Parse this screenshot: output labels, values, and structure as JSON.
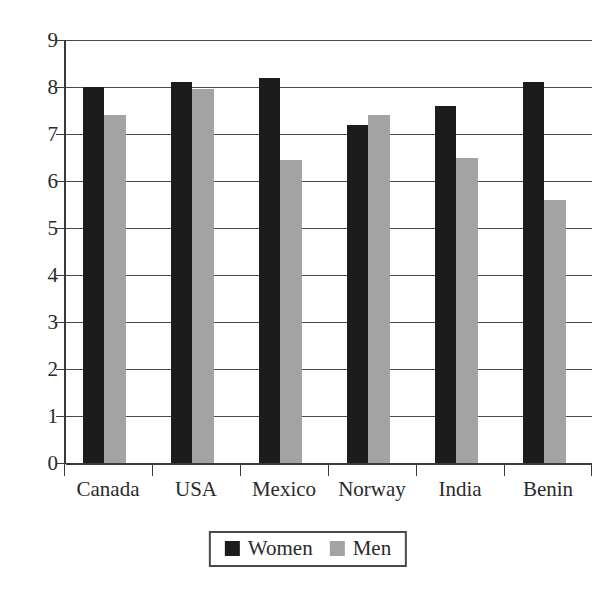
{
  "chart_data": {
    "type": "bar",
    "title": "",
    "subtitle": "",
    "xlabel": "",
    "ylabel": "",
    "categories": [
      "Canada",
      "USA",
      "Mexico",
      "Norway",
      "India",
      "Benin"
    ],
    "series": [
      {
        "name": "Women",
        "color": "#1c1c1c",
        "values": [
          8.0,
          8.1,
          8.2,
          7.2,
          7.6,
          8.1
        ]
      },
      {
        "name": "Men",
        "color": "#a3a3a3",
        "values": [
          7.4,
          7.95,
          6.45,
          7.4,
          6.5,
          5.6
        ]
      }
    ],
    "ylim": [
      0,
      9
    ],
    "ytick_labels": [
      "0",
      "1",
      "2",
      "3",
      "4",
      "5",
      "6",
      "7",
      "8",
      "9"
    ],
    "ytick_values": [
      0,
      1,
      2,
      3,
      4,
      5,
      6,
      7,
      8,
      9
    ],
    "grid": true,
    "grid_axis": "y",
    "legend": {
      "position": "bottom-center",
      "bordered": true,
      "entries": [
        {
          "label": "Women",
          "swatch": "black-square-swatch",
          "color": "#1c1c1c"
        },
        {
          "label": "Men",
          "swatch": "gray-square-swatch",
          "color": "#a3a3a3"
        }
      ]
    },
    "annotations": []
  },
  "axes": {
    "y": {
      "ticks": [
        {
          "label": "9",
          "value": 9
        },
        {
          "label": "8",
          "value": 8
        },
        {
          "label": "7",
          "value": 7
        },
        {
          "label": "6",
          "value": 6
        },
        {
          "label": "5",
          "value": 5
        },
        {
          "label": "4",
          "value": 4
        },
        {
          "label": "3",
          "value": 3
        },
        {
          "label": "2",
          "value": 2
        },
        {
          "label": "1",
          "value": 1
        },
        {
          "label": "0",
          "value": 0
        }
      ]
    },
    "x": {
      "ticks": [
        {
          "label": "Canada"
        },
        {
          "label": "USA"
        },
        {
          "label": "Mexico"
        },
        {
          "label": "Norway"
        },
        {
          "label": "India"
        },
        {
          "label": "Benin"
        }
      ]
    }
  }
}
